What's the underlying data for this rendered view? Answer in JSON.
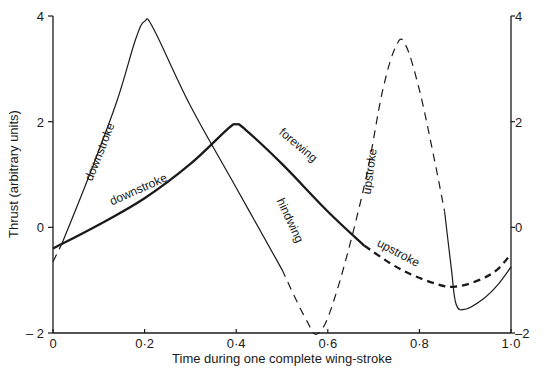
{
  "chart_data": {
    "type": "line",
    "title": "",
    "xlabel": "Time during one complete wing-stroke",
    "ylabel": "Thrust (arbitrary units)",
    "xlim": [
      0,
      1.0
    ],
    "ylim": [
      -2,
      4
    ],
    "x_ticks": [
      {
        "value": 0,
        "label": "0"
      },
      {
        "value": 0.2,
        "label": "0·2"
      },
      {
        "value": 0.4,
        "label": "0·4"
      },
      {
        "value": 0.6,
        "label": "0·6"
      },
      {
        "value": 0.8,
        "label": "0·8"
      },
      {
        "value": 1.0,
        "label": "1·0"
      }
    ],
    "y_ticks_left": [
      {
        "value": 4,
        "label": "4"
      },
      {
        "value": 2,
        "label": "2"
      },
      {
        "value": 0,
        "label": "0"
      },
      {
        "value": -2,
        "label": "– 2"
      }
    ],
    "y_ticks_right": [
      {
        "value": 4,
        "label": "4"
      },
      {
        "value": 2,
        "label": "2"
      },
      {
        "value": 0,
        "label": "0"
      },
      {
        "value": -2,
        "label": "–2"
      }
    ],
    "grid": false,
    "legend": "none",
    "series": [
      {
        "name": "hindwing",
        "color": "#1a1a1a",
        "weight": "thin",
        "segments": [
          {
            "style": "dashed",
            "points": [
              [
                0,
                -0.65
              ],
              [
                0.02,
                -0.3
              ]
            ]
          },
          {
            "style": "solid",
            "points": [
              [
                0.02,
                -0.3
              ],
              [
                0.08,
                1.0
              ],
              [
                0.14,
                2.4
              ],
              [
                0.18,
                3.55
              ],
              [
                0.2,
                3.9
              ],
              [
                0.22,
                3.75
              ],
              [
                0.3,
                2.3
              ],
              [
                0.4,
                0.75
              ],
              [
                0.5,
                -0.8
              ]
            ]
          },
          {
            "style": "dashed",
            "points": [
              [
                0.5,
                -0.8
              ],
              [
                0.55,
                -1.7
              ],
              [
                0.58,
                -2.0
              ],
              [
                0.62,
                -1.2
              ],
              [
                0.68,
                0.8
              ],
              [
                0.72,
                2.6
              ],
              [
                0.75,
                3.45
              ],
              [
                0.77,
                3.45
              ],
              [
                0.8,
                2.6
              ],
              [
                0.83,
                1.4
              ],
              [
                0.855,
                0.3
              ]
            ]
          },
          {
            "style": "solid",
            "points": [
              [
                0.855,
                0.3
              ],
              [
                0.87,
                -0.8
              ],
              [
                0.88,
                -1.45
              ],
              [
                0.9,
                -1.55
              ],
              [
                0.94,
                -1.35
              ],
              [
                0.97,
                -1.1
              ],
              [
                1.0,
                -0.75
              ]
            ]
          }
        ]
      },
      {
        "name": "forewing",
        "color": "#1a1a1a",
        "weight": "thick",
        "segments": [
          {
            "style": "solid",
            "points": [
              [
                0,
                -0.4
              ],
              [
                0.1,
                0.05
              ],
              [
                0.2,
                0.55
              ],
              [
                0.3,
                1.2
              ],
              [
                0.38,
                1.85
              ],
              [
                0.4,
                1.95
              ],
              [
                0.42,
                1.85
              ],
              [
                0.5,
                1.2
              ],
              [
                0.6,
                0.3
              ],
              [
                0.68,
                -0.35
              ]
            ]
          },
          {
            "style": "dashed",
            "points": [
              [
                0.68,
                -0.35
              ],
              [
                0.76,
                -0.8
              ],
              [
                0.84,
                -1.08
              ],
              [
                0.88,
                -1.12
              ],
              [
                0.93,
                -1.0
              ],
              [
                0.97,
                -0.8
              ],
              [
                1.0,
                -0.5
              ]
            ]
          }
        ]
      }
    ],
    "annotations": [
      {
        "text": "downstroke",
        "x": 0.11,
        "y": 1.4,
        "angle": -68,
        "series": "hindwing"
      },
      {
        "text": "downstroke",
        "x": 0.19,
        "y": 0.65,
        "angle": -24,
        "series": "forewing"
      },
      {
        "text": "forewing",
        "x": 0.53,
        "y": 1.5,
        "angle": 40,
        "series": "forewing"
      },
      {
        "text": "hindwing",
        "x": 0.51,
        "y": 0.1,
        "angle": 65,
        "series": "hindwing"
      },
      {
        "text": "upstroke",
        "x": 0.7,
        "y": 1.05,
        "angle": -82,
        "series": "hindwing"
      },
      {
        "text": "upstroke",
        "x": 0.75,
        "y": -0.55,
        "angle": 28,
        "series": "forewing"
      }
    ]
  }
}
